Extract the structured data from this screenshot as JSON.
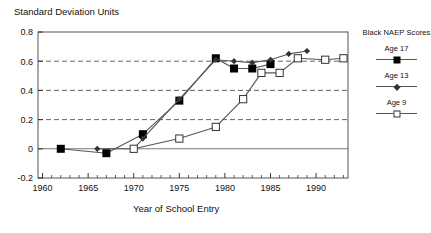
{
  "chart_data": {
    "type": "line",
    "title": "",
    "ylabel": "Standard Deviation Units",
    "xlabel": "Year of School Entry",
    "xlim": [
      1959.5,
      1993.5
    ],
    "ylim": [
      -0.2,
      0.8
    ],
    "grid": "horizontal-dashed",
    "xticks": [
      1960,
      1965,
      1970,
      1975,
      1980,
      1985,
      1990
    ],
    "xtick_labels": [
      "1960",
      "1965",
      "1970",
      "1975",
      "1980",
      "1985",
      "1990"
    ],
    "yticks": [
      -0.2,
      0,
      0.2,
      0.4,
      0.6,
      0.8
    ],
    "ytick_labels": [
      "-0.2",
      "0",
      "0.2",
      "0.4",
      "0.6",
      "0.8"
    ],
    "minor_xtick_step": 1,
    "minor_ytick_step": 0.1,
    "zero_line": 0,
    "legend_position": "right",
    "legend_title": "Black NAEP Scores",
    "series": [
      {
        "name": "Age 17",
        "marker": "filled-square",
        "color": "#000000",
        "x": [
          1962,
          1967,
          1971,
          1975,
          1979,
          1981,
          1983,
          1985
        ],
        "values": [
          0.0,
          -0.03,
          0.1,
          0.33,
          0.62,
          0.55,
          0.55,
          0.58
        ]
      },
      {
        "name": "Age 13",
        "marker": "filled-diamond",
        "color": "#333333",
        "x": [
          1966,
          1970,
          1971,
          1975,
          1979,
          1981,
          1983,
          1985,
          1987,
          1989
        ],
        "values": [
          0.0,
          0.0,
          0.07,
          0.34,
          0.61,
          0.6,
          0.59,
          0.61,
          0.65,
          0.67
        ]
      },
      {
        "name": "Age 9",
        "marker": "open-square",
        "color": "#333333",
        "x": [
          1970,
          1975,
          1979,
          1982,
          1984,
          1986,
          1988,
          1991,
          1993
        ],
        "values": [
          0.0,
          0.07,
          0.15,
          0.34,
          0.52,
          0.52,
          0.62,
          0.61,
          0.62
        ]
      }
    ]
  },
  "legend": {
    "title": "Black NAEP Scores",
    "entries": [
      {
        "label": "Age 17",
        "marker": "filled-square"
      },
      {
        "label": "Age 13",
        "marker": "filled-diamond"
      },
      {
        "label": "Age 9",
        "marker": "open-square"
      }
    ]
  },
  "axes": {
    "y_axis_title": "Standard Deviation Units",
    "x_axis_title": "Year of School Entry"
  }
}
